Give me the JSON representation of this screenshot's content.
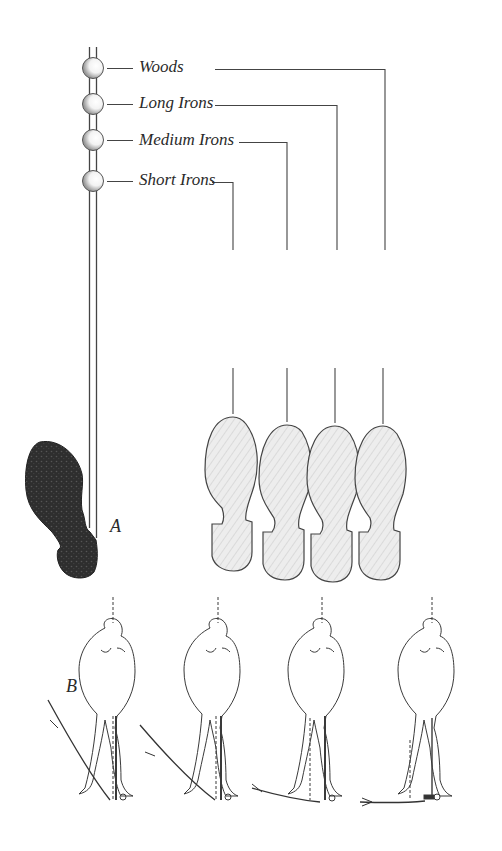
{
  "diagram": {
    "type": "golf stance / ball position illustration",
    "club_labels": [
      {
        "id": "woods",
        "text": "Woods"
      },
      {
        "id": "long-irons",
        "text": "Long Irons"
      },
      {
        "id": "medium-irons",
        "text": "Medium Irons"
      },
      {
        "id": "short-irons",
        "text": "Short Irons"
      }
    ],
    "panel_labels": {
      "a": "A",
      "b": "B"
    },
    "colors": {
      "ink": "#2a2a2a",
      "dark_shoe": "#333333",
      "light_shoe_fill": "#ececec",
      "background": "#ffffff"
    }
  }
}
